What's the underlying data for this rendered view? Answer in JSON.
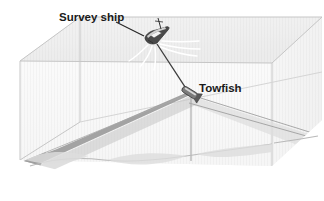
{
  "figure": {
    "type": "diagram",
    "background_color": "#ffffff"
  },
  "labels": {
    "survey_ship": "Survey ship",
    "towfish": "Towfish"
  },
  "elements": {
    "water_block_name": "water-column-block",
    "sea_surface_name": "sea-surface",
    "seafloor_name": "seafloor",
    "ship_name": "survey-ship",
    "towfish_name": "towfish-body",
    "tow_cable_name": "tow-cable",
    "wake_name": "ship-wake",
    "nadir_line_name": "nadir-line",
    "left_swath_name": "port-sonar-swath",
    "right_swath_name": "starboard-sonar-swath"
  },
  "colors": {
    "block_top": "#e2e2e2",
    "block_front": "#f0f0f0",
    "block_side": "#e8e8e8",
    "block_edge": "#c9c9c9",
    "seafloor": "#e6e6e6",
    "seafloor_line": "#b4b4b4",
    "swath_dark": "#9a9a9a",
    "swath_light": "#d8d8d8",
    "cable": "#4a4a4a",
    "ship_hull": "#3a3a3a",
    "label_text": "#1a1a1a",
    "leader_line": "#2b2b2b",
    "wake": "#ffffff"
  },
  "annotations": {
    "survey_ship_leader": "leader line from Survey ship label to ship",
    "towfish_leader": "label sits immediately right of towfish"
  }
}
